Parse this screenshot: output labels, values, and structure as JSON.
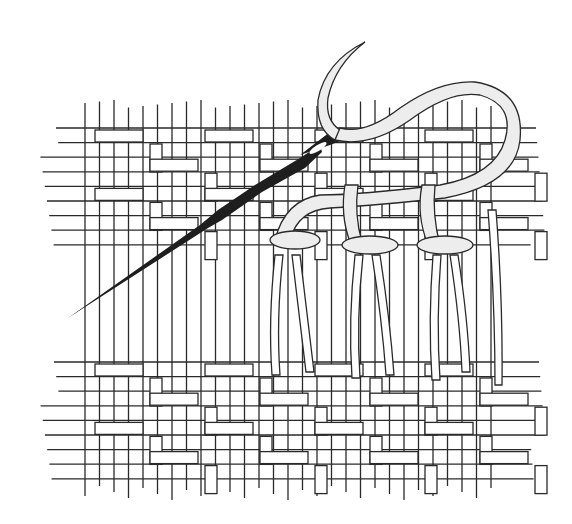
{
  "illustration": {
    "subject": "needle-and-thread-stitching-woven-fabric",
    "colors": {
      "background": "#ffffff",
      "line": "#2a2a2a",
      "needle": "#1e1e1e",
      "thread_fill": "#ededed"
    },
    "fabric": {
      "top_band": {
        "y_start": 128,
        "y_end": 245
      },
      "bottom_band": {
        "y_start": 362,
        "y_end": 485
      },
      "x_start": 40,
      "x_end": 545
    },
    "stitch_loops": 3
  }
}
